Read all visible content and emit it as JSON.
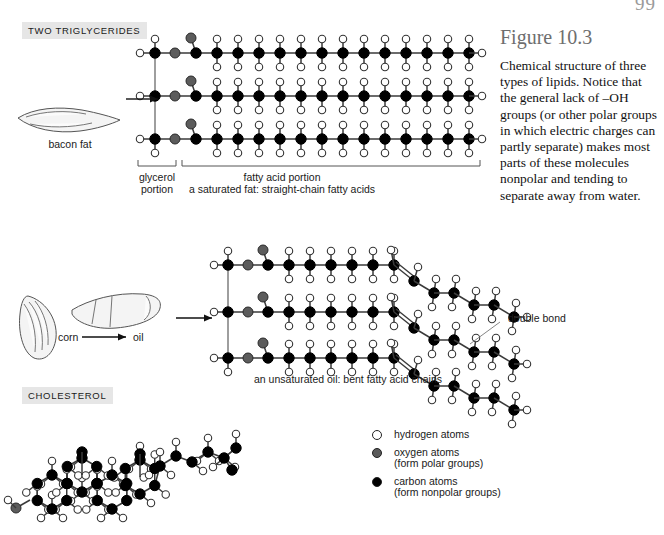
{
  "page": {
    "number": "99"
  },
  "caption": {
    "title": "Figure 10.3",
    "body": "Chemical structure of three types of lipids. Notice that the general lack of –OH groups (or other polar groups in which electric charges can partly separate) makes most parts of these molecules nonpolar and tending to separate away from water."
  },
  "sections": {
    "triglycerides_label": "TWO TRIGLYCERIDES",
    "cholesterol_label": "CHOLESTEROL"
  },
  "labels": {
    "bacon_fat": "bacon fat",
    "glycerol_portion_line1": "glycerol",
    "glycerol_portion_line2": "portion",
    "fatty_acid_portion": "fatty acid portion",
    "saturated_caption": "a saturated fat: straight-chain fatty acids",
    "corn": "corn",
    "oil": "oil",
    "double_bond": "double bond",
    "unsaturated_caption": "an unsaturated oil: bent fatty acid chains"
  },
  "legend": {
    "items": [
      {
        "icon": "hydrogen-atom-circle",
        "line1": "hydrogen atoms",
        "line2": ""
      },
      {
        "icon": "oxygen-atom-circle",
        "line1": "oxygen atoms",
        "line2": "(form polar groups)"
      },
      {
        "icon": "carbon-atom-circle",
        "line1": "carbon atoms",
        "line2": "(form nonpolar groups)"
      }
    ]
  },
  "colors": {
    "hydrogen": "#ffffff",
    "oxygen": "#5c5c5c",
    "carbon": "#000000",
    "bond": "#3a3a3a",
    "tag_background": "#e6e6e6",
    "caption_title": "#6e6e6e"
  }
}
